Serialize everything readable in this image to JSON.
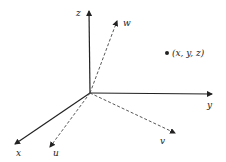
{
  "diagram": {
    "type": "coordinate-axes-3d",
    "origin": {
      "x": 90,
      "y": 93
    },
    "solid_axes": [
      {
        "name": "z",
        "label": "z",
        "tip": {
          "x": 89,
          "y": 10
        },
        "label_pos": {
          "x": 76,
          "y": 16
        }
      },
      {
        "name": "y",
        "label": "y",
        "tip": {
          "x": 213,
          "y": 94
        },
        "label_pos": {
          "x": 207,
          "y": 108
        }
      },
      {
        "name": "x",
        "label": "x",
        "tip": {
          "x": 14,
          "y": 145
        },
        "label_pos": {
          "x": 16,
          "y": 156
        }
      }
    ],
    "dashed_axes": [
      {
        "name": "w",
        "label": "w",
        "tip": {
          "x": 118,
          "y": 20
        },
        "label_pos": {
          "x": 124,
          "y": 26
        }
      },
      {
        "name": "v",
        "label": "v",
        "tip": {
          "x": 176,
          "y": 134
        },
        "label_pos": {
          "x": 160,
          "y": 144
        }
      },
      {
        "name": "u",
        "label": "u",
        "tip": {
          "x": 49,
          "y": 148
        },
        "label_pos": {
          "x": 53,
          "y": 156
        }
      }
    ],
    "point": {
      "label": "(x, y, z)",
      "pos": {
        "x": 167,
        "y": 53
      }
    },
    "colors": {
      "line": "#222222",
      "background": "#ffffff"
    }
  }
}
